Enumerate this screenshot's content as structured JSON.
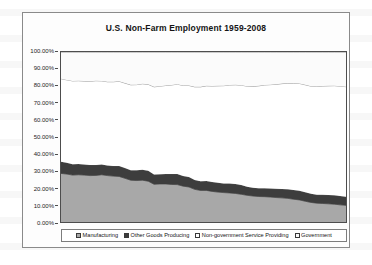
{
  "chart_data": {
    "type": "area",
    "title": "U.S. Non-Farm Employment 1959-2008",
    "xlabel": "",
    "ylabel": "",
    "ylim": [
      0,
      1
    ],
    "grid": false,
    "stacked": true,
    "legend_position": "bottom",
    "y_tick_labels": [
      "100.00%",
      "90.00%",
      "80.00%",
      "70.00%",
      "60.00%",
      "50.00%",
      "40.00%",
      "30.00%",
      "20.00%",
      "10.00%",
      "0.00%"
    ],
    "y_tick_values": [
      100,
      90,
      80,
      70,
      60,
      50,
      40,
      30,
      20,
      10,
      0
    ],
    "x": [
      1959,
      1960,
      1961,
      1962,
      1963,
      1964,
      1965,
      1966,
      1967,
      1968,
      1969,
      1970,
      1971,
      1972,
      1973,
      1974,
      1975,
      1976,
      1977,
      1978,
      1979,
      1980,
      1981,
      1982,
      1983,
      1984,
      1985,
      1986,
      1987,
      1988,
      1989,
      1990,
      1991,
      1992,
      1993,
      1994,
      1995,
      1996,
      1997,
      1998,
      1999,
      2000,
      2001,
      2002,
      2003,
      2004,
      2005,
      2006,
      2007,
      2008
    ],
    "series": [
      {
        "name": "Manufacturing",
        "color": "#a8a8a8",
        "values": [
          28.6,
          28.2,
          27.6,
          27.8,
          27.6,
          27.3,
          27.4,
          27.8,
          27.3,
          27.0,
          26.8,
          25.7,
          24.6,
          24.4,
          24.6,
          24.0,
          22.2,
          22.4,
          22.4,
          22.1,
          22.0,
          21.1,
          20.6,
          19.2,
          18.6,
          18.6,
          18.0,
          17.6,
          17.3,
          17.1,
          16.8,
          16.3,
          15.7,
          15.3,
          15.0,
          14.9,
          14.7,
          14.4,
          14.2,
          13.9,
          13.4,
          13.0,
          12.2,
          11.5,
          11.1,
          10.9,
          10.7,
          10.5,
          10.1,
          9.8
        ]
      },
      {
        "name": "Other Goods Producing",
        "color": "#3d3d3d",
        "values": [
          6.9,
          6.6,
          6.4,
          6.3,
          6.2,
          6.3,
          6.2,
          6.0,
          6.0,
          5.9,
          6.1,
          6.0,
          5.9,
          6.0,
          6.2,
          6.2,
          5.8,
          5.7,
          5.8,
          6.1,
          6.3,
          6.0,
          5.8,
          5.5,
          5.3,
          5.5,
          5.5,
          5.5,
          5.4,
          5.5,
          5.5,
          5.4,
          5.1,
          4.9,
          4.9,
          5.0,
          5.0,
          5.1,
          5.2,
          5.3,
          5.4,
          5.4,
          5.3,
          5.1,
          5.0,
          5.1,
          5.2,
          5.3,
          5.2,
          5.0
        ]
      },
      {
        "name": "Non-government Service Providing",
        "color": "#ffffff",
        "values": [
          48.8,
          48.8,
          49.0,
          49.0,
          49.1,
          49.2,
          49.5,
          49.2,
          49.2,
          49.6,
          49.9,
          50.0,
          50.2,
          50.4,
          50.5,
          50.8,
          51.5,
          51.8,
          52.1,
          52.4,
          52.8,
          53.2,
          53.9,
          54.8,
          55.6,
          56.0,
          56.5,
          57.0,
          57.5,
          58.0,
          58.4,
          58.8,
          59.1,
          59.6,
          60.2,
          60.7,
          61.1,
          61.5,
          62.0,
          62.4,
          62.8,
          63.1,
          63.2,
          63.3,
          63.6,
          64.0,
          64.2,
          64.4,
          64.6,
          64.8
        ]
      },
      {
        "name": "Government",
        "color": "#fbfbfb",
        "values": [
          15.7,
          16.4,
          17.0,
          16.9,
          17.1,
          17.2,
          16.9,
          17.0,
          17.5,
          17.5,
          17.2,
          18.3,
          19.3,
          19.2,
          18.7,
          19.0,
          20.5,
          20.1,
          19.7,
          19.4,
          18.9,
          19.7,
          19.7,
          20.5,
          20.5,
          19.9,
          20.0,
          19.9,
          19.8,
          19.4,
          19.3,
          19.5,
          20.1,
          20.2,
          19.9,
          19.4,
          19.2,
          19.0,
          18.6,
          18.4,
          18.4,
          18.5,
          19.3,
          20.1,
          20.3,
          20.0,
          19.9,
          19.8,
          20.1,
          20.4
        ]
      }
    ]
  },
  "legend": {
    "entries": [
      {
        "label": "Manufacturing"
      },
      {
        "label": "Other Goods Producing"
      },
      {
        "label": "Non-government Service Providing"
      },
      {
        "label": "Government"
      }
    ]
  }
}
